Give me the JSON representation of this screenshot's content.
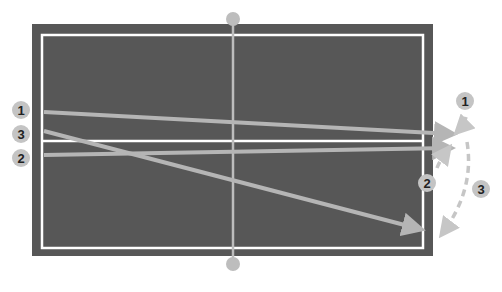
{
  "diagram": {
    "type": "table-tennis-serve-diagram",
    "colors": {
      "background": "#ffffff",
      "court": "#575757",
      "court_lines": "#ffffff",
      "net": "#bdbdbd",
      "arrows": "#b5b5b5",
      "badge_fill": "#c4c4c4",
      "badge_text": "#222222"
    },
    "court": {
      "x": 32,
      "y": 24,
      "width": 401,
      "height": 232
    },
    "inner_lines": {
      "x": 42,
      "y": 35,
      "width": 381,
      "height": 213,
      "center_y": 141
    },
    "net": {
      "x": 233,
      "top_post_y": 19,
      "bottom_post_y": 264
    },
    "left_labels": [
      {
        "text": "1",
        "cx": 21,
        "cy": 110
      },
      {
        "text": "3",
        "cx": 21,
        "cy": 134
      },
      {
        "text": "2",
        "cx": 21,
        "cy": 158
      }
    ],
    "right_labels": [
      {
        "text": "1",
        "cx": 465,
        "cy": 101
      },
      {
        "text": "2",
        "cx": 427,
        "cy": 183
      },
      {
        "text": "3",
        "cx": 481,
        "cy": 189
      }
    ],
    "serve_arrows": [
      {
        "id": "1",
        "x1": 44,
        "y1": 112,
        "x2": 452,
        "y2": 134
      },
      {
        "id": "2",
        "x1": 44,
        "y1": 155,
        "x2": 450,
        "y2": 148
      },
      {
        "id": "3",
        "x1": 44,
        "y1": 131,
        "x2": 420,
        "y2": 229
      }
    ],
    "return_arrows": [
      {
        "id": "1",
        "path": "M466 117 Q464 125 457 132"
      },
      {
        "id": "2",
        "path": "M437 168 Q440 160 449 148"
      },
      {
        "id": "3",
        "path": "M467 142 Q475 190 442 234"
      }
    ]
  }
}
